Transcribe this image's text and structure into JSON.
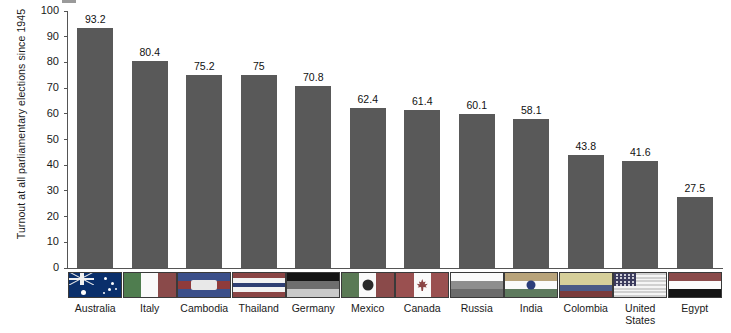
{
  "chart_data": {
    "type": "bar",
    "title": "",
    "xlabel": "",
    "ylabel": "Turnout at all parliamentary elections since 1945",
    "ylim": [
      0,
      100
    ],
    "yticks": [
      100,
      90,
      80,
      70,
      60,
      50,
      40,
      30,
      20,
      10,
      0
    ],
    "grid": false,
    "legend": "none",
    "bar_color": "#595959",
    "categories": [
      "Australia",
      "Italy",
      "Cambodia",
      "Thailand",
      "Germany",
      "Mexico",
      "Canada",
      "Russia",
      "India",
      "Colombia",
      "United States",
      "Egypt"
    ],
    "values": [
      93.2,
      80.4,
      75.2,
      75,
      70.8,
      62.4,
      61.4,
      60.1,
      58.1,
      43.8,
      41.6,
      27.5
    ],
    "value_labels": [
      "93.2",
      "80.4",
      "75.2",
      "75",
      "70.8",
      "62.4",
      "61.4",
      "60.1",
      "58.1",
      "43.8",
      "41.6",
      "27.5"
    ],
    "flags": [
      "australia-flag",
      "italy-flag",
      "cambodia-flag",
      "thailand-flag",
      "germany-flag",
      "mexico-flag",
      "canada-flag",
      "russia-flag",
      "india-flag",
      "colombia-flag",
      "united-states-flag",
      "egypt-flag"
    ]
  }
}
